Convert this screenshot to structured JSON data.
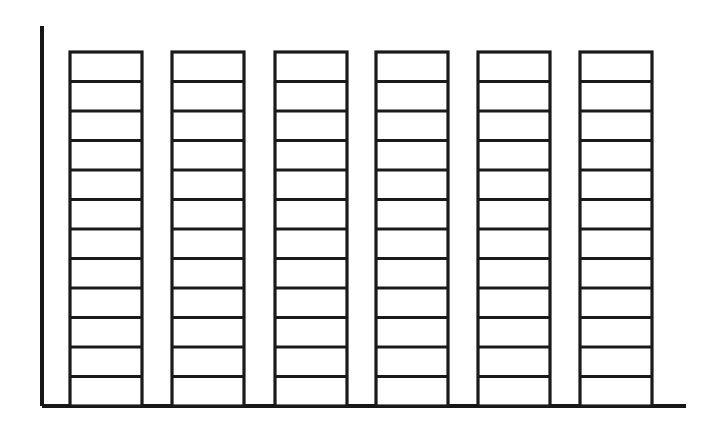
{
  "chart": {
    "title": "",
    "subtitle": "",
    "background_color": "#ffffff",
    "line_color": "#1a1a1a",
    "axis_color": "#161616",
    "bar_fill_color": "#ffffff"
  },
  "chart_data": {
    "type": "bar",
    "title": "",
    "subtitle": "",
    "xlabel": "",
    "ylabel": "",
    "categories": [
      "1",
      "2",
      "3",
      "4",
      "5",
      "6"
    ],
    "values": [
      12,
      12,
      12,
      12,
      12,
      12
    ],
    "series": [
      {
        "name": "segments",
        "values": [
          12,
          12,
          12,
          12,
          12,
          12
        ]
      }
    ],
    "segments_per_bar": 12,
    "bar_count": 6,
    "ylim": [
      0,
      12
    ],
    "xlim": [
      0,
      6
    ],
    "grid": false,
    "legend": false,
    "legend_position": "none",
    "tick_labels_x": [],
    "tick_labels_y": [],
    "annotations": []
  },
  "geometry": {
    "axis": {
      "y_axis_x": 42,
      "y_axis_top": 26,
      "y_axis_bottom": 406,
      "x_axis_left": 42,
      "x_axis_right": 686,
      "x_axis_y": 406,
      "y_axis_width": 4.0,
      "x_axis_width": 4.0
    },
    "bars": [
      {
        "name": "bar-1",
        "x": 70,
        "width": 72,
        "top": 52,
        "bottom": 406,
        "segments": 12
      },
      {
        "name": "bar-2",
        "x": 172,
        "width": 72,
        "top": 52,
        "bottom": 406,
        "segments": 12
      },
      {
        "name": "bar-3",
        "x": 275,
        "width": 72,
        "top": 52,
        "bottom": 406,
        "segments": 12
      },
      {
        "name": "bar-4",
        "x": 376,
        "width": 72,
        "top": 52,
        "bottom": 406,
        "segments": 12
      },
      {
        "name": "bar-5",
        "x": 478,
        "width": 72,
        "top": 52,
        "bottom": 406,
        "segments": 12
      },
      {
        "name": "bar-6",
        "x": 580,
        "width": 72,
        "top": 52,
        "bottom": 406,
        "segments": 12
      }
    ]
  }
}
